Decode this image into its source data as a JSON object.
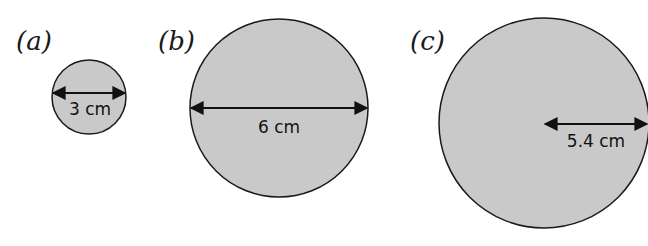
{
  "colors": {
    "circle_fill": "#c9c9c9",
    "circle_stroke": "#1a1a1a",
    "arrow": "#111111"
  },
  "figures": [
    {
      "label": "(a)",
      "measure": "diameter",
      "dimension": "3 cm"
    },
    {
      "label": "(b)",
      "measure": "diameter",
      "dimension": "6 cm"
    },
    {
      "label": "(c)",
      "measure": "radius",
      "dimension": "5.4 cm"
    }
  ]
}
